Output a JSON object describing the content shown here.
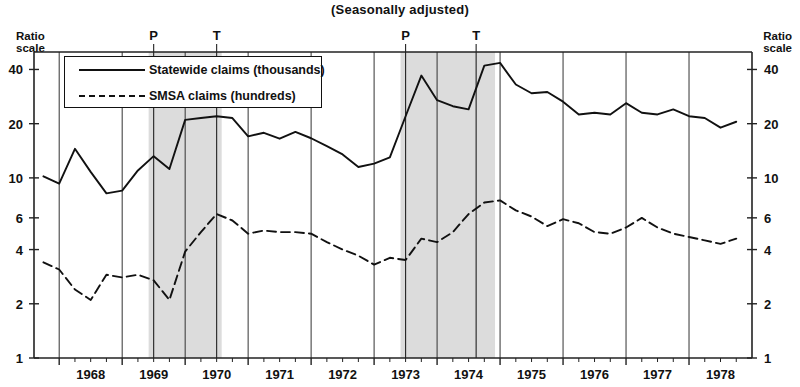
{
  "subtitle": "(Seasonally adjusted)",
  "axis": {
    "ratio_scale_label": "Ratio\nscale",
    "left_label": "Ratio scale",
    "right_label": "Ratio scale"
  },
  "legend": {
    "items": [
      {
        "key": "solid-line",
        "label": "Statewide claims (thousands)"
      },
      {
        "key": "dashed-line",
        "label": "SMSA claims (hundreds)"
      }
    ]
  },
  "markers": [
    {
      "label": "P",
      "x": 1969.5
    },
    {
      "label": "T",
      "x": 1970.5
    },
    {
      "label": "P",
      "x": 1973.5
    },
    {
      "label": "T",
      "x": 1974.62
    }
  ],
  "chart_data": {
    "type": "line",
    "title": "(Seasonally adjusted)",
    "xlabel": "",
    "ylabel": "Ratio scale",
    "scale": "log",
    "grid": true,
    "legend_position": "top-left",
    "xlim": [
      1967.6,
      1979.0
    ],
    "ylim": [
      1,
      50
    ],
    "yticks": [
      1,
      2,
      4,
      6,
      10,
      20,
      40
    ],
    "ytick_labels": [
      "1",
      "2",
      "4",
      "6",
      "10",
      "20",
      "40"
    ],
    "xticks": [
      1968,
      1969,
      1970,
      1971,
      1972,
      1973,
      1974,
      1975,
      1976,
      1977,
      1978
    ],
    "xtick_labels": [
      "1968",
      "1969",
      "1970",
      "1971",
      "1972",
      "1973",
      "1974",
      "1975",
      "1976",
      "1977",
      "1978"
    ],
    "shaded_bands": [
      {
        "name": "recession-1969-1970",
        "x0": 1969.42,
        "x1": 1970.58,
        "color": "#dcdcdc"
      },
      {
        "name": "recession-1973-1975",
        "x0": 1973.42,
        "x1": 1974.92,
        "color": "#dcdcdc"
      }
    ],
    "vertical_rules": [
      1969.5,
      1970.5,
      1973.5,
      1974.62
    ],
    "series": [
      {
        "name": "Statewide claims (thousands)",
        "style": "solid",
        "color": "#111111",
        "x": [
          1967.75,
          1968.0,
          1968.25,
          1968.5,
          1968.75,
          1969.0,
          1969.25,
          1969.5,
          1969.75,
          1970.0,
          1970.25,
          1970.5,
          1970.75,
          1971.0,
          1971.25,
          1971.5,
          1971.75,
          1972.0,
          1972.25,
          1972.5,
          1972.75,
          1973.0,
          1973.25,
          1973.5,
          1973.75,
          1974.0,
          1974.25,
          1974.5,
          1974.75,
          1975.0,
          1975.25,
          1975.5,
          1975.75,
          1976.0,
          1976.25,
          1976.5,
          1976.75,
          1977.0,
          1977.25,
          1977.5,
          1977.75,
          1978.0,
          1978.25,
          1978.5,
          1978.75
        ],
        "values": [
          10.2,
          9.3,
          14.5,
          10.8,
          8.2,
          8.5,
          11.0,
          13.2,
          11.2,
          21.0,
          21.5,
          22.0,
          21.5,
          17.0,
          17.8,
          16.5,
          18.0,
          16.6,
          15.0,
          13.5,
          11.5,
          12.0,
          13.0,
          22.0,
          37.0,
          27.0,
          25.0,
          24.0,
          42.0,
          43.5,
          33.0,
          29.5,
          30.0,
          26.5,
          22.5,
          23.0,
          22.5,
          26.0,
          23.0,
          22.5,
          24.0,
          22.0,
          21.5,
          19.0,
          20.5
        ]
      },
      {
        "name": "SMSA claims (hundreds)",
        "style": "dashed",
        "color": "#111111",
        "x": [
          1967.75,
          1968.0,
          1968.25,
          1968.5,
          1968.75,
          1969.0,
          1969.25,
          1969.5,
          1969.75,
          1970.0,
          1970.25,
          1970.5,
          1970.75,
          1971.0,
          1971.25,
          1971.5,
          1971.75,
          1972.0,
          1972.25,
          1972.5,
          1972.75,
          1973.0,
          1973.25,
          1973.5,
          1973.75,
          1974.0,
          1974.25,
          1974.5,
          1974.75,
          1975.0,
          1975.25,
          1975.5,
          1975.75,
          1976.0,
          1976.25,
          1976.5,
          1976.75,
          1977.0,
          1977.25,
          1977.5,
          1977.75,
          1978.0,
          1978.25,
          1978.5,
          1978.75
        ],
        "values": [
          3.4,
          3.1,
          2.4,
          2.1,
          2.9,
          2.8,
          2.9,
          2.7,
          2.1,
          3.9,
          5.0,
          6.3,
          5.8,
          4.9,
          5.1,
          5.0,
          5.0,
          4.9,
          4.4,
          4.0,
          3.7,
          3.3,
          3.6,
          3.5,
          4.6,
          4.4,
          5.0,
          6.3,
          7.3,
          7.5,
          6.6,
          6.1,
          5.4,
          5.9,
          5.6,
          5.0,
          4.9,
          5.3,
          6.0,
          5.3,
          4.9,
          4.7,
          4.5,
          4.3,
          4.6
        ]
      }
    ]
  }
}
